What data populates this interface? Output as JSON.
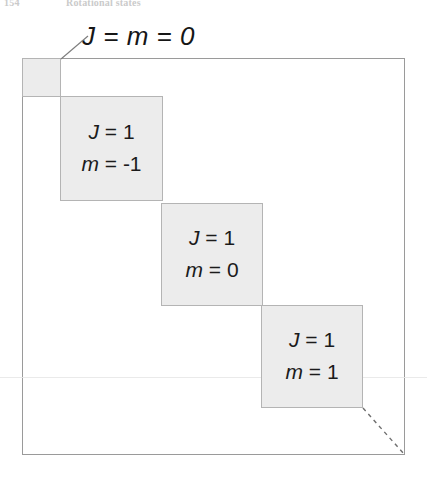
{
  "page": {
    "running_head": {
      "folio": "154",
      "chapter_title": "Rotational states"
    }
  },
  "figure": {
    "name": "block-diagonal-matrix-figure",
    "outer_box": {
      "label": "matrix-outline",
      "border_color": "#9a9a9a"
    },
    "callout": {
      "label": "J = m = 0",
      "leader_line": "diagonal-leader"
    },
    "block_fill_color": "#ececec",
    "block_border_color": "#b4b4b4",
    "blocks": [
      {
        "id": "block-0",
        "line1": "",
        "line2": "",
        "has_text": false
      },
      {
        "id": "block-1",
        "line1_var": "J",
        "line1_op": "=",
        "line1_val": "1",
        "line2_var": "m",
        "line2_op": "=",
        "line2_val": "-1"
      },
      {
        "id": "block-2",
        "line1_var": "J",
        "line1_op": "=",
        "line1_val": "1",
        "line2_var": "m",
        "line2_op": "=",
        "line2_val": "0"
      },
      {
        "id": "block-3",
        "line1_var": "J",
        "line1_op": "=",
        "line1_val": "1",
        "line2_var": "m",
        "line2_op": "=",
        "line2_val": "1"
      }
    ],
    "dashed_continuation": {
      "label": "ellipsis-diagonal",
      "color": "#6e6e6e"
    }
  }
}
